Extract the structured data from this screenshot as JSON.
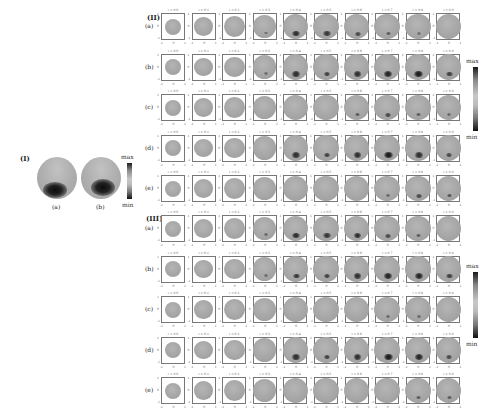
{
  "section_I": {
    "label": "(I)",
    "panels": [
      {
        "label": "(a)",
        "spot": {
          "x": 0.45,
          "y": 0.78,
          "w": 0.62,
          "h": 0.38
        }
      },
      {
        "label": "(b)",
        "spot": {
          "x": 0.55,
          "y": 0.72,
          "w": 0.62,
          "h": 0.4
        }
      }
    ],
    "colorbar": {
      "max": "max",
      "min": "min"
    }
  },
  "section_II": {
    "label": "(II)",
    "colorbar": {
      "max": "max",
      "min": "min"
    },
    "time_labels": [
      "t = 0.0",
      "t = 0.1",
      "t = 0.2",
      "t = 0.3",
      "t = 0.4",
      "t = 0.5",
      "t = 0.6",
      "t = 0.7",
      "t = 0.8",
      "t = 0.9"
    ],
    "axis_ticks": {
      "x": [
        "-1",
        "0",
        "1"
      ],
      "y": [
        "1",
        "0",
        "-1"
      ]
    },
    "rows": [
      {
        "label": "(a)",
        "spots": [
          0,
          0,
          0,
          0.15,
          0.8,
          0.7,
          0.5,
          0.3,
          0.1,
          0
        ]
      },
      {
        "label": "(b)",
        "spots": [
          0,
          0,
          0,
          0.15,
          0.8,
          0.6,
          0.8,
          0.9,
          1.0,
          0.6
        ]
      },
      {
        "label": "(c)",
        "spots": [
          0,
          0,
          0,
          0,
          0,
          0,
          0.3,
          0.5,
          0.3,
          0.2
        ]
      },
      {
        "label": "(d)",
        "spots": [
          0,
          0,
          0,
          0,
          0.8,
          0.6,
          0.8,
          1.0,
          0.8,
          0.5
        ]
      },
      {
        "label": "(e)",
        "spots": [
          0,
          0,
          0,
          0,
          0,
          0,
          0,
          0.2,
          0.5,
          0.4
        ]
      }
    ]
  },
  "section_III": {
    "label": "(III)",
    "colorbar": {
      "max": "max",
      "min": "min"
    },
    "time_labels": [
      "t = 0.0",
      "t = 0.1",
      "t = 0.2",
      "t = 0.3",
      "t = 0.4",
      "t = 0.5",
      "t = 0.6",
      "t = 0.7",
      "t = 0.8",
      "t = 0.9"
    ],
    "axis_ticks": {
      "x": [
        "-1",
        "0",
        "1"
      ],
      "y": [
        "1",
        "0",
        "-1"
      ]
    },
    "rows": [
      {
        "label": "(a)",
        "spots": [
          0,
          0,
          0,
          0.2,
          0.8,
          0.7,
          0.8,
          0.5,
          0.3,
          0
        ]
      },
      {
        "label": "(b)",
        "spots": [
          0,
          0,
          0,
          0.15,
          0.7,
          0.6,
          0.8,
          0.9,
          0.9,
          0.6
        ]
      },
      {
        "label": "(c)",
        "spots": [
          0,
          0,
          0,
          0,
          0,
          0,
          0,
          0.2,
          0.2,
          0
        ]
      },
      {
        "label": "(d)",
        "spots": [
          0,
          0,
          0,
          0,
          0.8,
          0.6,
          0.8,
          1.0,
          0.9,
          0.5
        ]
      },
      {
        "label": "(e)",
        "spots": [
          0,
          0,
          0,
          0,
          0,
          0,
          0,
          0,
          0.3,
          0.3
        ]
      }
    ]
  }
}
